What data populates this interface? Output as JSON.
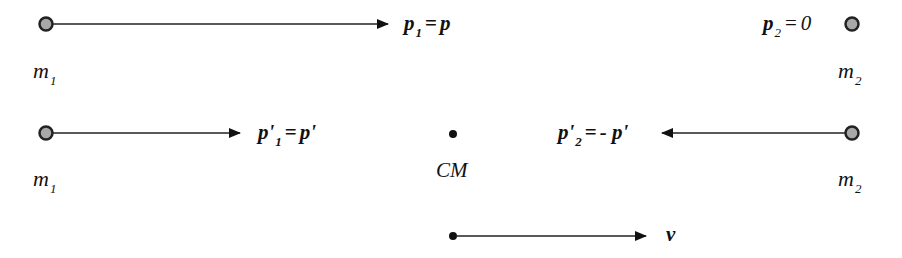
{
  "diagram": {
    "colors": {
      "line": "#111111",
      "mass_fill": "#a8a8a8",
      "mass_stroke": "#222222",
      "background": "#ffffff"
    },
    "row1": {
      "m1": {
        "symbol": "m",
        "subscript": "1"
      },
      "m2": {
        "symbol": "m",
        "subscript": "2"
      },
      "p1_label": {
        "symbol": "p",
        "subscript": "1",
        "equals": "=",
        "rhs": "p"
      },
      "p2_label": {
        "symbol": "p",
        "subscript": "2",
        "equals": "=",
        "rhs": "0"
      }
    },
    "row2": {
      "m1": {
        "symbol": "m",
        "subscript": "1"
      },
      "m2": {
        "symbol": "m",
        "subscript": "2"
      },
      "p1_prime_label": {
        "symbol": "p'",
        "subscript": "1",
        "equals": "=",
        "rhs": "p'"
      },
      "p2_prime_label": {
        "symbol": "p'",
        "subscript": "2",
        "equals": "=",
        "rhs": "- p'"
      },
      "cm_label": "CM"
    },
    "row3": {
      "velocity_label": "v"
    }
  }
}
